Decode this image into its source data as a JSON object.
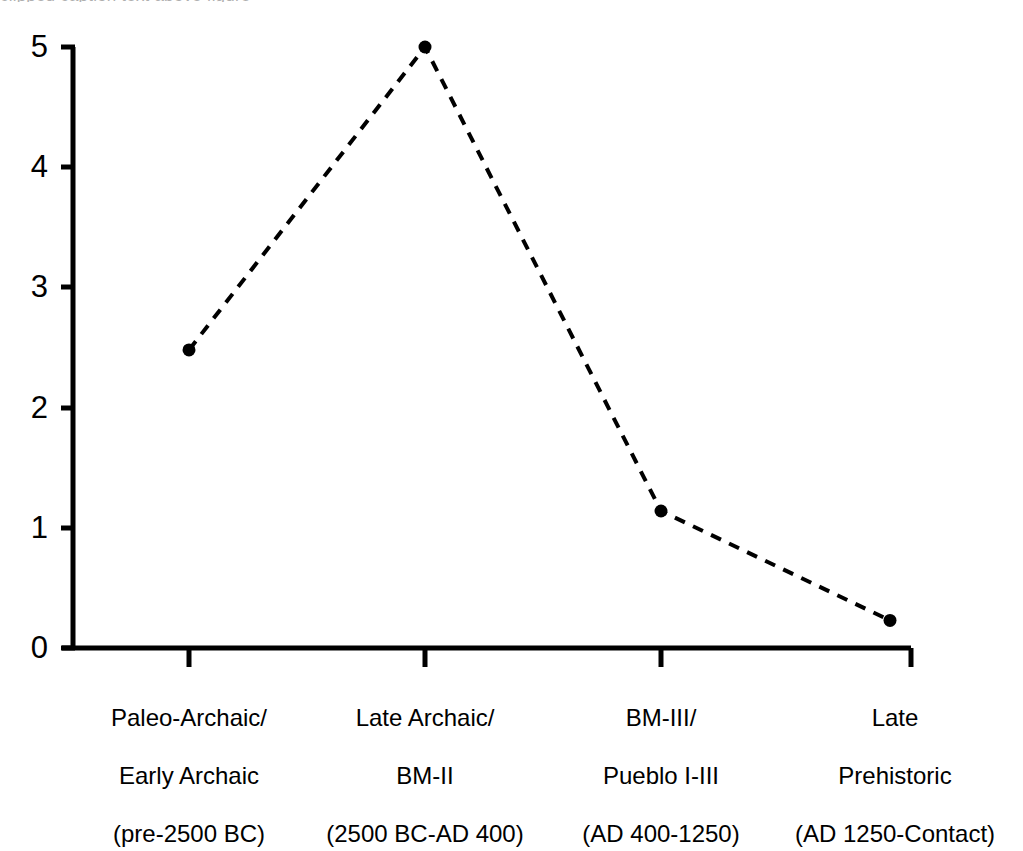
{
  "figure": {
    "background_color": "#ffffff",
    "ink_color": "#000000",
    "top_cut_caption": "clipped caption text above figure"
  },
  "chart_data": {
    "type": "line",
    "title": "",
    "subtitle": "",
    "xlabel": "",
    "ylabel": "",
    "categories": [
      "Paleo-Archaic/\nEarly Archaic\n(pre-2500 BC)",
      "Late Archaic/\nBM-II\n(2500 BC-AD 400)",
      "BM-III/\nPueblo I-III\n(AD 400-1250)",
      "Late\nPrehistoric\n(AD 1250-Contact)"
    ],
    "category_lines": [
      [
        "Paleo-Archaic/",
        "Early Archaic",
        "(pre-2500 BC)"
      ],
      [
        "Late Archaic/",
        "BM-II",
        "(2500 BC-AD 400)"
      ],
      [
        "BM-III/",
        "Pueblo I-III",
        "(AD 400-1250)"
      ],
      [
        "Late",
        "Prehistoric",
        "(AD 1250-Contact)"
      ]
    ],
    "values": [
      2.48,
      5.0,
      1.14,
      0.23
    ],
    "ylim": [
      0,
      5
    ],
    "yticks": [
      0,
      1,
      2,
      3,
      4,
      5
    ],
    "ytick_labels": [
      "0",
      "1",
      "2",
      "3",
      "4",
      "5"
    ],
    "grid": false,
    "legend": null,
    "series": [
      {
        "name": "",
        "values": [
          2.48,
          5.0,
          1.14,
          0.23
        ],
        "line_style": "dashed",
        "line_color": "#000000",
        "line_width": 4,
        "dash_pattern": "11 9",
        "marker": "circle",
        "marker_color": "#000000",
        "marker_size": 13
      }
    ]
  }
}
